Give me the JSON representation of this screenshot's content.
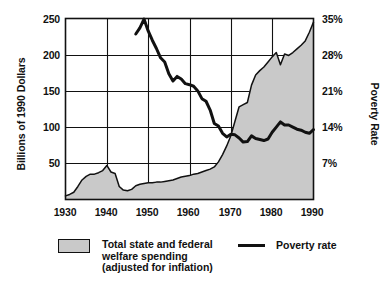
{
  "chart_data": {
    "type": "area",
    "title": "",
    "xlabel": "",
    "ylabel": "Billions of 1990 Dollars",
    "y2label": "Poverty Rate",
    "xlim": [
      1930,
      1990
    ],
    "ylim": [
      0,
      250
    ],
    "y2lim": [
      0,
      35
    ],
    "grid": true,
    "legend_position": "bottom",
    "x_ticks": [
      "1930",
      "1940",
      "1950",
      "1960",
      "1970",
      "1980",
      "1990"
    ],
    "x_tick_values": [
      1930,
      1940,
      1950,
      1960,
      1970,
      1980,
      1990
    ],
    "y_ticks": [
      "50",
      "100",
      "150",
      "200",
      "250"
    ],
    "y_tick_values": [
      50,
      100,
      150,
      200,
      250
    ],
    "y2_ticks": [
      "7%",
      "14%",
      "21%",
      "28%",
      "35%"
    ],
    "y2_tick_values": [
      7,
      14,
      21,
      28,
      35
    ],
    "series": [
      {
        "name": "Total state and federal welfare spending (adjusted for inflation)",
        "type": "area",
        "axis": "left",
        "units": "Billions of 1990 Dollars",
        "fill_color": "#c9c9c9",
        "line_color": "#111111",
        "x": [
          1930,
          1931,
          1932,
          1933,
          1934,
          1935,
          1936,
          1937,
          1938,
          1939,
          1940,
          1941,
          1942,
          1943,
          1944,
          1945,
          1946,
          1947,
          1948,
          1949,
          1950,
          1951,
          1952,
          1953,
          1954,
          1955,
          1956,
          1957,
          1958,
          1959,
          1960,
          1961,
          1962,
          1963,
          1964,
          1965,
          1966,
          1967,
          1968,
          1969,
          1970,
          1971,
          1972,
          1973,
          1974,
          1975,
          1976,
          1977,
          1978,
          1979,
          1980,
          1981,
          1982,
          1983,
          1984,
          1985,
          1986,
          1987,
          1988,
          1989,
          1990
        ],
        "y": [
          5,
          7,
          10,
          18,
          27,
          32,
          35,
          35,
          37,
          40,
          47,
          38,
          36,
          18,
          13,
          12,
          14,
          19,
          21,
          22,
          23,
          23,
          24,
          24,
          25,
          26,
          27,
          29,
          31,
          32,
          33,
          35,
          36,
          38,
          40,
          42,
          45,
          52,
          62,
          74,
          88,
          108,
          128,
          131,
          134,
          158,
          172,
          178,
          183,
          190,
          197,
          203,
          186,
          201,
          199,
          203,
          208,
          213,
          219,
          231,
          245
        ]
      },
      {
        "name": "Poverty rate",
        "type": "line",
        "axis": "right",
        "units": "%",
        "line_color": "#111111",
        "x": [
          1947,
          1948,
          1949,
          1950,
          1951,
          1952,
          1953,
          1954,
          1955,
          1956,
          1957,
          1958,
          1959,
          1960,
          1961,
          1962,
          1963,
          1964,
          1965,
          1966,
          1967,
          1968,
          1969,
          1970,
          1971,
          1972,
          1973,
          1974,
          1975,
          1976,
          1977,
          1978,
          1979,
          1980,
          1981,
          1982,
          1983,
          1984,
          1985,
          1986,
          1987,
          1988,
          1989,
          1990
        ],
        "y": [
          32.0,
          33.2,
          34.9,
          32.6,
          30.8,
          29.2,
          27.4,
          26.6,
          24.3,
          22.9,
          23.8,
          23.3,
          22.4,
          22.2,
          21.9,
          21.0,
          19.5,
          19.0,
          17.3,
          14.7,
          14.2,
          12.8,
          12.1,
          12.6,
          12.5,
          11.9,
          11.1,
          11.2,
          12.3,
          11.8,
          11.6,
          11.4,
          11.7,
          13.0,
          14.0,
          15.0,
          14.4,
          14.4,
          14.0,
          13.6,
          13.4,
          13.0,
          12.8,
          13.5
        ]
      }
    ]
  },
  "axes": {
    "y_left": {
      "title": "Billions of 1990 Dollars",
      "ticks": [
        "250",
        "200",
        "150",
        "100",
        "50"
      ]
    },
    "y_right": {
      "title": "Poverty Rate",
      "ticks": [
        "35%",
        "28%",
        "21%",
        "14%",
        "7%"
      ]
    },
    "x": {
      "ticks": [
        "1930",
        "1940",
        "1950",
        "1960",
        "1970",
        "1980",
        "1990"
      ]
    }
  },
  "legend": {
    "spending": {
      "label": "Total state and federal\nwelfare spending\n(adjusted for inflation)",
      "swatch": "filled-rectangle-swatch"
    },
    "poverty": {
      "label": "Poverty rate",
      "swatch": "line-swatch"
    }
  },
  "colors": {
    "area_fill": "#c9c9c9",
    "line": "#111111",
    "grid": "#111111",
    "background": "#ffffff"
  }
}
